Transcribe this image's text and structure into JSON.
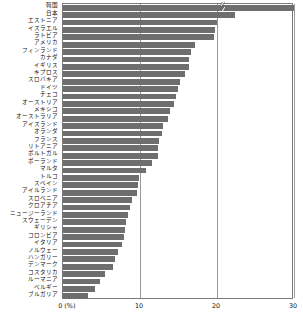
{
  "chart_data": {
    "type": "bar",
    "orientation": "horizontal",
    "title": "",
    "subtitle": "",
    "xlabel": "(%)",
    "ylabel": "",
    "xlim": [
      0,
      30
    ],
    "xticks": [
      0,
      10,
      20,
      30
    ],
    "xtick_labels": [
      "0 (%)",
      "10",
      "20",
      "30"
    ],
    "grid": true,
    "legend": "none",
    "bar_color": "#6e6e6e",
    "axis_color": "#7a7a7a",
    "note": "Top bar (韓国) is drawn with an axis-break (zigzag) mark indicating a truncated value beyond the 30% axis maximum.",
    "axis_break": {
      "present": true,
      "series_index": 0,
      "category": "韓国",
      "position_pct": 20.8
    },
    "categories": [
      "韓国",
      "日本",
      "エストニア",
      "イスラエル",
      "ラトビア",
      "アメリカ",
      "フィンランド",
      "カナダ",
      "イギリス",
      "キプロス",
      "スロバキア",
      "ドイツ",
      "チェコ",
      "オーストリア",
      "メキシコ",
      "オーストラリア",
      "アイスランド",
      "オランダ",
      "フランス",
      "リトアニア",
      "ポルトガル",
      "ポーランド",
      "マルタ",
      "トルコ",
      "スペイン",
      "アイルランド",
      "スロベニア",
      "クロアチア",
      "ニュージーランド",
      "スウェーデン",
      "ギリシャ",
      "コロンビア",
      "イタリア",
      "ノルウェー",
      "ハンガリー",
      "デンマーク",
      "コスタリカ",
      "ルーマニア",
      "ベルギー",
      "ブルガリア"
    ],
    "values": [
      30.0,
      22.3,
      20.0,
      19.7,
      19.6,
      17.2,
      16.6,
      16.4,
      16.3,
      15.9,
      15.2,
      14.9,
      14.7,
      14.4,
      13.9,
      13.6,
      13.0,
      12.8,
      12.5,
      12.4,
      12.3,
      11.5,
      10.8,
      9.9,
      9.7,
      9.6,
      9.0,
      8.7,
      8.5,
      8.2,
      8.1,
      7.9,
      7.7,
      7.2,
      6.8,
      6.5,
      5.4,
      4.8,
      4.2,
      3.2
    ]
  }
}
